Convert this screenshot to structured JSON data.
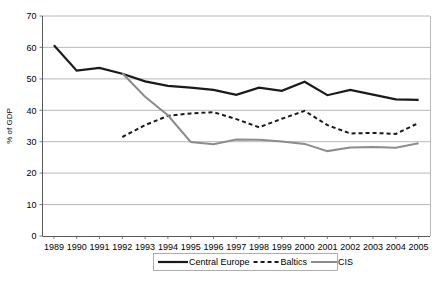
{
  "chart_data": {
    "type": "line",
    "title": "",
    "xlabel": "",
    "ylabel": "% of GDP",
    "ylim": [
      0,
      70
    ],
    "ytick_step": 10,
    "yticks": [
      "0",
      "10",
      "20",
      "30",
      "40",
      "50",
      "60",
      "70"
    ],
    "grid": true,
    "legend_position": "bottom-center",
    "categories": [
      "1989",
      "1990",
      "1991",
      "1992",
      "1993",
      "1994",
      "1995",
      "1996",
      "1997",
      "1998",
      "1999",
      "2000",
      "2001",
      "2002",
      "2003",
      "2004",
      "2005"
    ],
    "series": [
      {
        "name": "Central Europe",
        "color": "#1a1a1a",
        "style": "solid",
        "width": 2.2,
        "values": [
          60.7,
          52.6,
          53.5,
          51.6,
          49.2,
          47.8,
          47.2,
          46.5,
          44.9,
          47.2,
          46.2,
          49.1,
          44.8,
          46.5,
          45.0,
          43.5,
          43.3
        ]
      },
      {
        "name": "Baltics",
        "color": "#1a1a1a",
        "style": "dashed",
        "width": 2.0,
        "values": [
          null,
          null,
          null,
          31.5,
          35.3,
          38.2,
          39.0,
          39.4,
          37.2,
          34.6,
          37.3,
          39.8,
          35.3,
          32.6,
          32.8,
          32.5,
          33.0
        ]
      },
      {
        "name": "CIS",
        "color": "#8c8c8c",
        "style": "solid",
        "width": 2.0,
        "values": [
          null,
          null,
          null,
          51.8,
          44.3,
          38.4,
          29.9,
          29.2,
          30.7,
          30.6,
          30.1,
          29.3,
          27.0,
          28.2,
          28.3,
          28.1,
          29.4
        ]
      }
    ],
    "series_tail_note": {
      "Baltics_2005": 36.0,
      "CIS_2005": 29.5
    }
  },
  "legend": {
    "items": [
      {
        "label": "Central Europe",
        "swatch": "solid-black-thick"
      },
      {
        "label": "Baltics",
        "swatch": "dashed-black"
      },
      {
        "label": "CIS",
        "swatch": "solid-gray"
      }
    ]
  },
  "axes": {
    "y_axis_title": "% of GDP",
    "y_tick_labels": [
      "70",
      "60",
      "50",
      "40",
      "30",
      "20",
      "10",
      "0"
    ],
    "x_tick_labels": [
      "1989",
      "1990",
      "1991",
      "1992",
      "1993",
      "1994",
      "1995",
      "1996",
      "1997",
      "1998",
      "1999",
      "2000",
      "2001",
      "2002",
      "2003",
      "2004",
      "2005"
    ]
  },
  "colors": {
    "central_europe": "#1a1a1a",
    "baltics": "#1a1a1a",
    "cis": "#8c8c8c",
    "grid": "#a6a6a6",
    "axis": "#5a5a5a",
    "background": "#ffffff"
  }
}
